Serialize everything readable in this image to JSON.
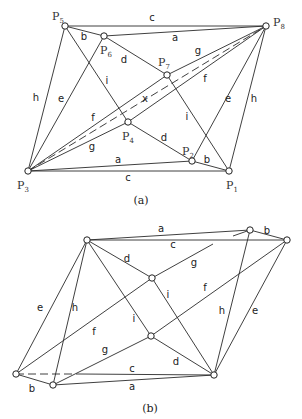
{
  "figure_a": {
    "caption": "(a)",
    "nodes": [
      {
        "id": "P1",
        "base": "P",
        "sub": "1",
        "x": 229,
        "y": 171,
        "lx": 226,
        "ly": 189
      },
      {
        "id": "P2",
        "base": "P",
        "sub": "2",
        "x": 192,
        "y": 161,
        "lx": 182,
        "ly": 155
      },
      {
        "id": "P3",
        "base": "P",
        "sub": "3",
        "x": 28,
        "y": 171,
        "lx": 17,
        "ly": 189
      },
      {
        "id": "P4",
        "base": "P",
        "sub": "4",
        "x": 128,
        "y": 122,
        "lx": 122,
        "ly": 140
      },
      {
        "id": "P5",
        "base": "P",
        "sub": "5",
        "x": 65,
        "y": 26,
        "lx": 52,
        "ly": 20
      },
      {
        "id": "P6",
        "base": "P",
        "sub": "6",
        "x": 104,
        "y": 36,
        "lx": 100,
        "ly": 54
      },
      {
        "id": "P7",
        "base": "P",
        "sub": "7",
        "x": 167,
        "y": 75,
        "lx": 158,
        "ly": 66
      },
      {
        "id": "P8",
        "base": "P",
        "sub": "8",
        "x": 266,
        "y": 26,
        "lx": 273,
        "ly": 26
      }
    ],
    "edge_labels": [
      {
        "t": "c",
        "x": 152,
        "y": 21
      },
      {
        "t": "a",
        "x": 175,
        "y": 41
      },
      {
        "t": "b",
        "x": 84,
        "y": 40
      },
      {
        "t": "d",
        "x": 124,
        "y": 63
      },
      {
        "t": "g",
        "x": 198,
        "y": 54
      },
      {
        "t": "f",
        "x": 205,
        "y": 82
      },
      {
        "t": "i",
        "x": 107,
        "y": 84
      },
      {
        "t": "e",
        "x": 61,
        "y": 102
      },
      {
        "t": "h",
        "x": 36,
        "y": 101
      },
      {
        "t": "x",
        "x": 145,
        "y": 102
      },
      {
        "t": "f",
        "x": 93,
        "y": 121
      },
      {
        "t": "d",
        "x": 164,
        "y": 141
      },
      {
        "t": "i",
        "x": 187,
        "y": 120
      },
      {
        "t": "e",
        "x": 228,
        "y": 102
      },
      {
        "t": "h",
        "x": 254,
        "y": 102
      },
      {
        "t": "g",
        "x": 92,
        "y": 150
      },
      {
        "t": "a",
        "x": 118,
        "y": 163
      },
      {
        "t": "c",
        "x": 128,
        "y": 181
      },
      {
        "t": "b",
        "x": 207,
        "y": 163
      }
    ]
  },
  "figure_b": {
    "caption": "(b)",
    "nodes": [
      {
        "id": "TL",
        "x": 87,
        "y": 240
      },
      {
        "id": "TR1",
        "x": 250,
        "y": 230
      },
      {
        "id": "TR2",
        "x": 287,
        "y": 240
      },
      {
        "id": "M1",
        "x": 152,
        "y": 278
      },
      {
        "id": "M2",
        "x": 151,
        "y": 336
      },
      {
        "id": "BL1",
        "x": 16,
        "y": 374
      },
      {
        "id": "BL2",
        "x": 53,
        "y": 385
      },
      {
        "id": "BR",
        "x": 214,
        "y": 375
      }
    ],
    "edge_labels": [
      {
        "t": "a",
        "x": 161,
        "y": 232
      },
      {
        "t": "b",
        "x": 267,
        "y": 234
      },
      {
        "t": "c",
        "x": 173,
        "y": 248
      },
      {
        "t": "d",
        "x": 127,
        "y": 262
      },
      {
        "t": "g",
        "x": 194,
        "y": 266
      },
      {
        "t": "i",
        "x": 168,
        "y": 298
      },
      {
        "t": "f",
        "x": 205,
        "y": 291
      },
      {
        "t": "h",
        "x": 222,
        "y": 314
      },
      {
        "t": "e",
        "x": 255,
        "y": 314
      },
      {
        "t": "e",
        "x": 40,
        "y": 311
      },
      {
        "t": "h",
        "x": 75,
        "y": 311
      },
      {
        "t": "f",
        "x": 94,
        "y": 335
      },
      {
        "t": "i",
        "x": 134,
        "y": 322
      },
      {
        "t": "g",
        "x": 105,
        "y": 353
      },
      {
        "t": "c",
        "x": 132,
        "y": 372
      },
      {
        "t": "d",
        "x": 176,
        "y": 365
      },
      {
        "t": "a",
        "x": 132,
        "y": 390
      },
      {
        "t": "b",
        "x": 32,
        "y": 392
      }
    ]
  }
}
